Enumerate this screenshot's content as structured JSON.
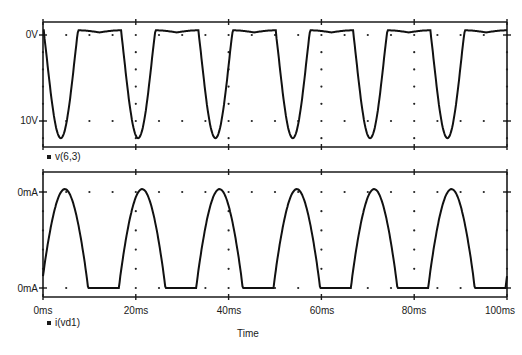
{
  "chart_data": [
    {
      "type": "line",
      "title": "",
      "xlabel": "Time",
      "ylabel": "",
      "x_unit": "ms",
      "xlim": [
        0,
        100
      ],
      "ylim": [
        -12,
        1
      ],
      "y_tick_labels": [
        "0V",
        "10V"
      ],
      "y_tick_values": [
        0,
        -10
      ],
      "grid": "dotted",
      "legend": [
        "v(6,3)"
      ],
      "series": [
        {
          "name": "v(6,3)",
          "description": "Clipped negative half-sine: flat near +0.5V, dips to about -12V once per 16.7ms cycle",
          "x": [
            0,
            5,
            8,
            10,
            12,
            14,
            16.7,
            21.7,
            25,
            27,
            29,
            31,
            33.3,
            38.3,
            41.7,
            43.7,
            45.7,
            47.7,
            50,
            55,
            58.3,
            60.3,
            62.3,
            64.3,
            66.7,
            71.7,
            75,
            77,
            79,
            81,
            83.3,
            88.3,
            91.7,
            93.7,
            95.7,
            97.7,
            100
          ],
          "values": [
            0.3,
            0.5,
            0.2,
            -5,
            -12,
            -5,
            0.4,
            0.5,
            0.2,
            -5,
            -12,
            -5,
            0.4,
            0.5,
            0.2,
            -5,
            -12,
            -5,
            0.4,
            0.5,
            0.2,
            -5,
            -12,
            -5,
            0.4,
            0.5,
            0.2,
            -5,
            -12,
            -5,
            0.4,
            0.5,
            0.2,
            -5,
            -12,
            -5,
            0.5
          ]
        }
      ]
    },
    {
      "type": "line",
      "title": "",
      "xlabel": "Time",
      "ylabel": "",
      "x_unit": "ms",
      "xlim": [
        0,
        100
      ],
      "x_tick_labels": [
        "0ms",
        "20ms",
        "40ms",
        "60ms",
        "80ms",
        "100ms"
      ],
      "x_tick_values": [
        0,
        20,
        40,
        60,
        80,
        100
      ],
      "y_tick_labels": [
        "0mA",
        "0mA"
      ],
      "y_tick_position": [
        "top",
        "bottom"
      ],
      "grid": "dotted",
      "legend": [
        "i(vd1)"
      ],
      "series": [
        {
          "name": "i(vd1)",
          "description": "Half-wave rectified current pulses, one per 16.7ms cycle, zero between pulses",
          "x": [
            0,
            2.5,
            5,
            7.5,
            10,
            18,
            20.8,
            23.2,
            25.8,
            34.5,
            37.4,
            39.9,
            42.5,
            51.2,
            54,
            56.6,
            59.2,
            68,
            70.9,
            73.3,
            75.8,
            84.5,
            87.5,
            90,
            92.5,
            100
          ],
          "values": [
            0,
            0.8,
            1.02,
            0.6,
            0,
            0,
            1.02,
            0.6,
            0,
            0,
            1.02,
            0.6,
            0,
            0,
            1.02,
            0.6,
            0,
            0,
            1.02,
            0.6,
            0,
            0,
            1.02,
            0.6,
            0,
            0
          ]
        }
      ]
    }
  ],
  "upper_plot": {
    "y_ticks": [
      "0V",
      "10V"
    ],
    "legend_label": "v(6,3)"
  },
  "lower_plot": {
    "y_ticks": [
      "0mA",
      "0mA"
    ],
    "legend_label": "i(vd1)"
  },
  "x_axis": {
    "ticks": [
      "0ms",
      "20ms",
      "40ms",
      "60ms",
      "80ms",
      "100ms"
    ],
    "label": "Time"
  }
}
